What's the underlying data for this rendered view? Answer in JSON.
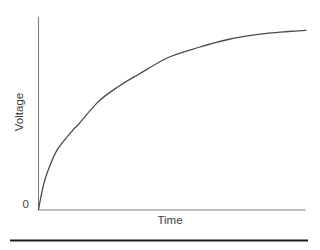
{
  "figure": {
    "y_axis_label": "Voltage",
    "x_axis_label": "Time",
    "origin_label": "0"
  },
  "colors": {
    "curve": "#4a4a4a",
    "axis": "#7d7d7d",
    "text": "#3c3c3c",
    "rule": "#1c1c1c",
    "background": "#ffffff"
  },
  "chart_data": {
    "type": "line",
    "xlabel": "Time",
    "ylabel": "Voltage",
    "x_tick_labels": [
      "0"
    ],
    "y_tick_labels": [],
    "grid": false,
    "legend": false,
    "x_range": [
      0,
      1
    ],
    "y_range": [
      0,
      1
    ],
    "shape_note": "normalized curve approximately v = 1 - exp(-4.3t); flattens toward asymptote at right edge",
    "series": [
      {
        "name": "voltage",
        "points": [
          [
            0,
            0
          ],
          [
            0.019,
            0.137
          ],
          [
            0.037,
            0.22
          ],
          [
            0.071,
            0.33
          ],
          [
            0.131,
            0.44
          ],
          [
            0.149,
            0.467
          ],
          [
            0.224,
            0.593
          ],
          [
            0.299,
            0.676
          ],
          [
            0.373,
            0.742
          ],
          [
            0.485,
            0.835
          ],
          [
            0.597,
            0.89
          ],
          [
            0.709,
            0.934
          ],
          [
            0.821,
            0.962
          ],
          [
            0.933,
            0.978
          ],
          [
            1,
            0.984
          ]
        ]
      }
    ]
  }
}
